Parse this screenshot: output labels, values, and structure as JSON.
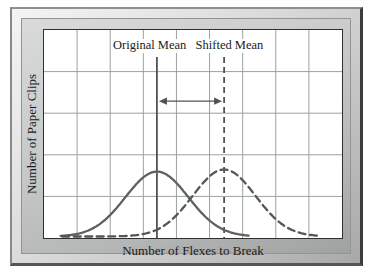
{
  "chart_data": {
    "type": "line",
    "title": "",
    "xlabel": "Number of Flexes to Break",
    "ylabel": "Number of Paper Clips",
    "x_range": [
      0,
      9
    ],
    "y_range": [
      0,
      5
    ],
    "grid": true,
    "grid_cols": 9,
    "grid_rows": 5,
    "tick_labels": "none",
    "legend": "none",
    "series": [
      {
        "name": "original-distribution",
        "shape": "gaussian",
        "mean": 3.41,
        "sd": 0.95,
        "peak": 1.56,
        "x_start": 0.5,
        "x_end": 6.2,
        "line_style": "solid",
        "color": "#5d6163"
      },
      {
        "name": "shifted-distribution",
        "shape": "gaussian",
        "mean": 5.44,
        "sd": 0.95,
        "peak": 1.61,
        "x_start": 0.55,
        "x_end": 8.35,
        "line_style": "dashed",
        "color": "#535759"
      }
    ],
    "annotations": [
      {
        "type": "vline",
        "label": "Original Mean",
        "x": 3.41,
        "label_x": 3.16,
        "y_top": 4.35,
        "style": "solid"
      },
      {
        "type": "vline",
        "label": "Shifted Mean",
        "x": 5.44,
        "label_x": 5.57,
        "y_top": 4.35,
        "style": "dashed"
      },
      {
        "type": "double_arrow",
        "from_x": 3.41,
        "to_x": 5.44,
        "y": 3.29
      }
    ],
    "colors": {
      "grid": "#9ba1a1",
      "plot_border": "#2f2f2f",
      "annotation": "#4f5355",
      "text": "#1a1a1a",
      "frame_bevel_light": "#f4f4f4",
      "frame_matte": "#c2c4c4",
      "frame_edge_dark": "#3c3c3c"
    }
  }
}
